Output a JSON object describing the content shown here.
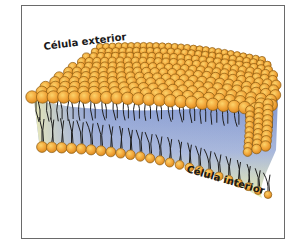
{
  "figure": {
    "labels": {
      "outside": "Célula exterior",
      "inside": "Célula interior"
    },
    "colors": {
      "head_fill": "#f2a63a",
      "head_stroke": "#8a5a10",
      "head_highlight": "#f9c95a",
      "tail": "#1e1e1e",
      "core_blue": "#8ea3d6",
      "core_yellow": "#eef0b0",
      "frame": "#6a6a6a"
    }
  }
}
